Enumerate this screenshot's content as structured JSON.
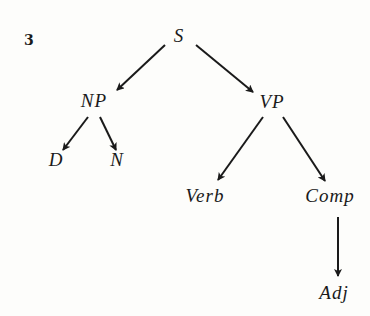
{
  "figure": {
    "number": "3",
    "type": "tree-diagram",
    "nodes": [
      {
        "id": "S",
        "label": "S",
        "x": 179,
        "y": 36
      },
      {
        "id": "NP",
        "label": "NP",
        "x": 94,
        "y": 101
      },
      {
        "id": "VP",
        "label": "VP",
        "x": 272,
        "y": 102
      },
      {
        "id": "D",
        "label": "D",
        "x": 56,
        "y": 160
      },
      {
        "id": "N",
        "label": "N",
        "x": 117,
        "y": 160
      },
      {
        "id": "Verb",
        "label": "Verb",
        "x": 205,
        "y": 196
      },
      {
        "id": "Comp",
        "label": "Comp",
        "x": 330,
        "y": 196
      },
      {
        "id": "Adj",
        "label": "Adj",
        "x": 334,
        "y": 293
      }
    ],
    "edges": [
      {
        "from": "S",
        "to": "NP"
      },
      {
        "from": "S",
        "to": "VP"
      },
      {
        "from": "NP",
        "to": "D"
      },
      {
        "from": "NP",
        "to": "N"
      },
      {
        "from": "VP",
        "to": "Verb"
      },
      {
        "from": "VP",
        "to": "Comp"
      },
      {
        "from": "Comp",
        "to": "Adj"
      }
    ],
    "line_color": "#1a1a1a"
  }
}
